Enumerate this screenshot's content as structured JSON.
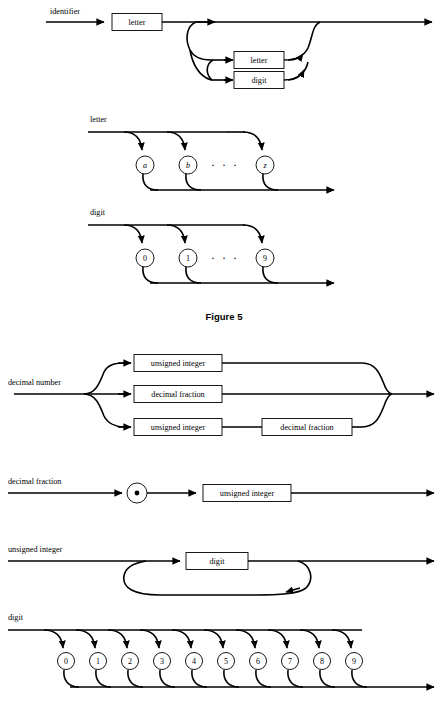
{
  "page": {
    "width": 448,
    "height": 710,
    "background": "#ffffff",
    "ink": "#000000"
  },
  "figure_caption": "Figure 5",
  "diagrams": [
    {
      "id": "identifier",
      "name": "identifier",
      "label": "identifier",
      "boxes": [
        "letter",
        "letter",
        "digit"
      ],
      "description": "identifier is a letter followed by zero or more letters or digits"
    },
    {
      "id": "letter-upper",
      "name": "letter",
      "label": "letter",
      "terminals": [
        "a",
        "b",
        "z"
      ],
      "ellipsis": "· · ·",
      "description": "letter is one of a through z"
    },
    {
      "id": "digit-upper",
      "name": "digit",
      "label": "digit",
      "terminals": [
        "0",
        "1",
        "9"
      ],
      "ellipsis": "· · ·",
      "description": "digit is one of 0 through 9"
    },
    {
      "id": "decimal-number",
      "name": "decimal number",
      "label": "decimal number",
      "branches": [
        [
          "unsigned integer"
        ],
        [
          "decimal fraction"
        ],
        [
          "unsigned integer",
          "decimal fraction"
        ]
      ]
    },
    {
      "id": "decimal-fraction",
      "name": "decimal fraction",
      "label": "decimal fraction",
      "terminal": ".",
      "boxes": [
        "unsigned integer"
      ]
    },
    {
      "id": "unsigned-integer",
      "name": "unsigned integer",
      "label": "unsigned integer",
      "boxes": [
        "digit"
      ],
      "description": "unsigned integer is one or more digits"
    },
    {
      "id": "digit-lower",
      "name": "digit",
      "label": "digit",
      "terminals": [
        "0",
        "1",
        "2",
        "3",
        "4",
        "5",
        "6",
        "7",
        "8",
        "9"
      ]
    }
  ],
  "labels": {
    "identifier": "identifier",
    "letter": "letter",
    "digit": "digit",
    "decimal_number": "decimal number",
    "decimal_fraction": "decimal fraction",
    "unsigned_integer": "unsigned integer",
    "decimal_point": "•"
  }
}
